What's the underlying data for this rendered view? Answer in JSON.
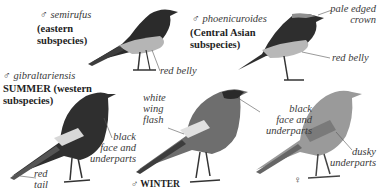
{
  "plate": {
    "birds": [
      {
        "id": "semirufus",
        "sex_symbol": "♂",
        "name": "semirufus",
        "caption_line1": "(eastern",
        "caption_line2": "subspecies)",
        "annotations": [
          {
            "text": "red belly"
          }
        ]
      },
      {
        "id": "phoenicuroides",
        "sex_symbol": "♂",
        "name": "phoenicuroides",
        "caption_line1": "(Central Asian",
        "caption_line2": "subspecies)",
        "annotations": [
          {
            "line1": "pale edged",
            "line2": "crown"
          },
          {
            "text": "red belly"
          }
        ]
      },
      {
        "id": "gibraltariensis",
        "sex_symbol": "♂",
        "name": "gibraltariensis",
        "caption_line1": "SUMMER (western",
        "caption_line2": "subspecies)",
        "annotations": [
          {
            "line1": "black",
            "line2": "face and",
            "line3": "underparts"
          },
          {
            "line1": "red",
            "line2": "tail"
          }
        ]
      },
      {
        "id": "winter-male",
        "sex_symbol": "♂",
        "caption": "WINTER",
        "annotations": [
          {
            "line1": "white",
            "line2": "wing",
            "line3": "flash"
          },
          {
            "line1": "black",
            "line2": "face and",
            "line3": "underparts"
          }
        ]
      },
      {
        "id": "female",
        "sex_symbol": "♀",
        "annotations": [
          {
            "line1": "dusky",
            "line2": "underparts"
          }
        ]
      }
    ],
    "colors": {
      "background": "#ffffff",
      "bird_dark": "#2b2b2b",
      "bird_mid": "#7a7a7a",
      "bird_light": "#b8b8b8",
      "text": "#2a2a2a"
    }
  }
}
